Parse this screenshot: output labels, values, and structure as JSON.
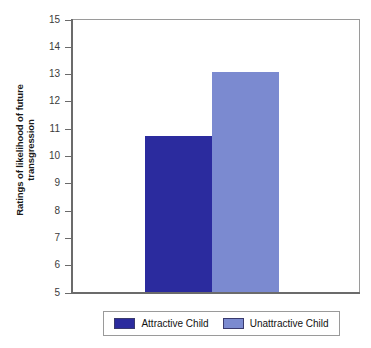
{
  "chart_data": {
    "type": "bar",
    "title": "",
    "xlabel": "",
    "ylabel_line1": "Ratings of likelihood of future",
    "ylabel_line2": "transgression",
    "ylabel": "Ratings of likelihood of future transgression",
    "categories": [
      "Attractive Child",
      "Unattractive Child"
    ],
    "values": [
      10.75,
      13.1
    ],
    "ylim": [
      5,
      15
    ],
    "yticks": [
      15,
      14,
      13,
      12,
      11,
      10,
      9,
      8,
      7,
      6,
      5
    ],
    "ytick_labels": [
      "15",
      "14",
      "13",
      "12",
      "11",
      "10",
      "9",
      "8",
      "7",
      "6",
      "5"
    ],
    "grid": false,
    "legend_position": "bottom",
    "legend": [
      {
        "label": "Attractive Child",
        "color": "#2b2b9e"
      },
      {
        "label": "Unattractive Child",
        "color": "#7b8ad0"
      }
    ],
    "colors": {
      "attractive": "#2b2b9e",
      "unattractive": "#7b8ad0",
      "axis": "#6b6b6b",
      "frame": "#9a9a9a",
      "background": "#ffffff"
    }
  }
}
